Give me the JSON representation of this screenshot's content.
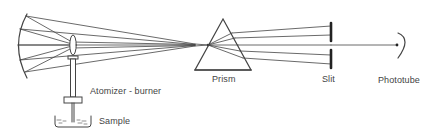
{
  "diagram": {
    "type": "flame-photometer-optical-schematic",
    "colors": {
      "line": "#444444",
      "background": "#ffffff"
    },
    "components": [
      {
        "id": "concave-mirror",
        "label": ""
      },
      {
        "id": "lens",
        "label": ""
      },
      {
        "id": "atomizer-burner",
        "label": "Atomizer - burner"
      },
      {
        "id": "sample",
        "label": "Sample"
      },
      {
        "id": "prism",
        "label": "Prism"
      },
      {
        "id": "slit",
        "label": "Slit"
      },
      {
        "id": "phototube",
        "label": "Phototube"
      }
    ],
    "labels": {
      "atomizer_burner": "Atomizer - burner",
      "sample": "Sample",
      "prism": "Prism",
      "slit": "Slit",
      "phototube": "Phototube"
    },
    "flow": [
      "Sample",
      "Atomizer - burner",
      "Prism",
      "Slit",
      "Phototube"
    ]
  }
}
